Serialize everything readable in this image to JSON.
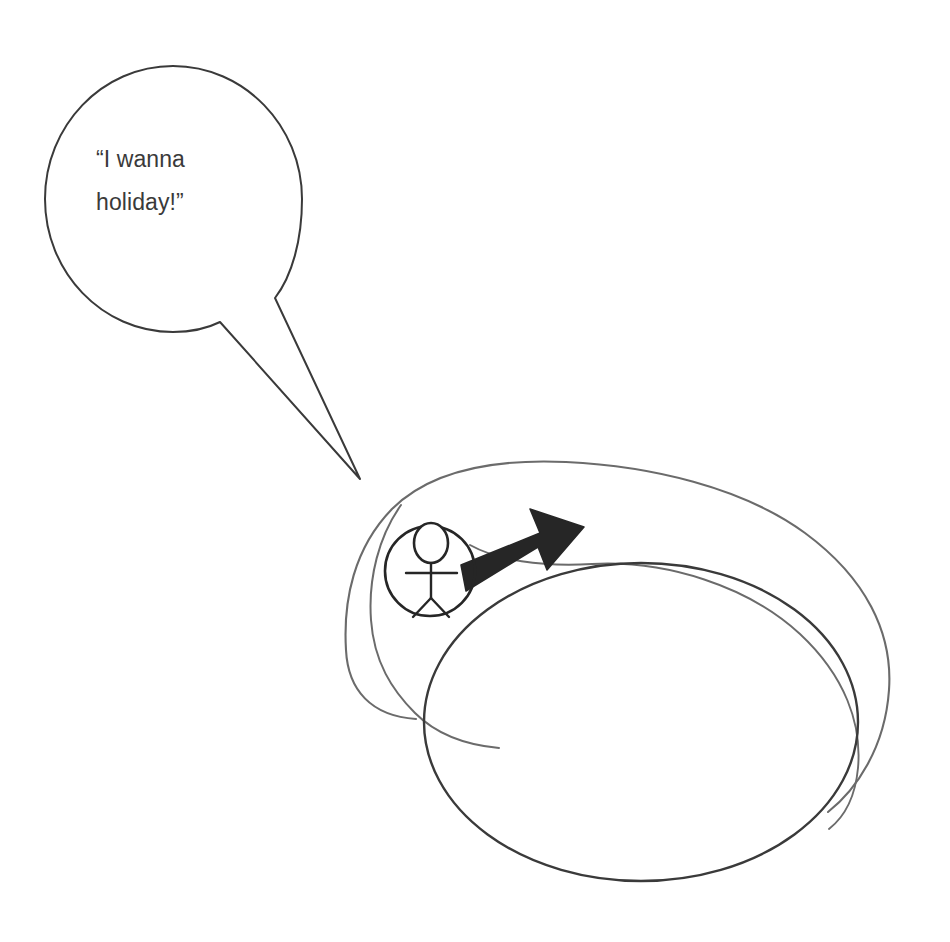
{
  "canvas": {
    "width": 950,
    "height": 942,
    "background": "#ffffff"
  },
  "diagram": {
    "type": "hand-drawn sketch",
    "ink_color": "#3a3a3a",
    "arrow_color": "#262626"
  },
  "speech_bubble": {
    "name": "speech-bubble",
    "shape": "ellipse",
    "text": "“I wanna\nholiday!”",
    "line_1": "“I wanna",
    "line_2": "holiday!”",
    "stroke": "#3a3a3a",
    "fill": "#ffffff",
    "center_x": 173,
    "center_y": 199,
    "radius_x": 129,
    "radius_y": 133,
    "tail_tip_x": 360,
    "tail_tip_y": 479
  },
  "stick_figure": {
    "name": "stick-figure-in-circle",
    "circle_center_x": 430,
    "circle_center_y": 571,
    "circle_radius": 45,
    "stroke": "#262626"
  },
  "arrow": {
    "name": "black-arrow",
    "direction": "right",
    "from_x": 461,
    "from_y": 580,
    "to_x": 583,
    "to_y": 528,
    "color": "#262626"
  },
  "swirl": {
    "name": "swirl-outline",
    "description": "outer looping curve",
    "stroke": "#6b6b6b"
  },
  "inner_ellipse": {
    "name": "inner-ellipse",
    "center_x": 641,
    "center_y": 722,
    "radius_x": 217,
    "radius_y": 159,
    "stroke": "#3a3a3a"
  }
}
